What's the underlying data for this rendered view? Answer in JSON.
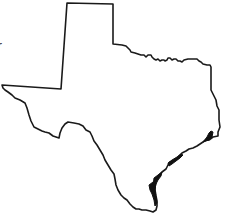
{
  "map": {
    "subject": "Texas state outline",
    "stroke_color": "#1a1a1a",
    "background_color": "#ffffff"
  },
  "labels": {
    "cropped_left_text": "r"
  }
}
